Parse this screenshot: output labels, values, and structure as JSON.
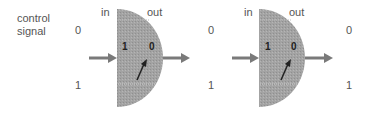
{
  "title_label": {
    "line1": "control",
    "line2": "signal"
  },
  "gates": [
    {
      "in_label": "in",
      "out_label": "out",
      "inner_left": "1",
      "inner_right": "0",
      "left_states": [
        "0",
        "1"
      ],
      "right_states": [
        "0",
        "1"
      ]
    },
    {
      "in_label": "in",
      "out_label": "out",
      "inner_left": "1",
      "inner_right": "0",
      "left_states": [
        "0",
        "1"
      ],
      "right_states": [
        "0",
        "1"
      ]
    }
  ],
  "colors": {
    "gate_fill": "#a3a3a3",
    "arrow": "#7a7a7a",
    "needle": "#222222",
    "text": "#555555"
  }
}
